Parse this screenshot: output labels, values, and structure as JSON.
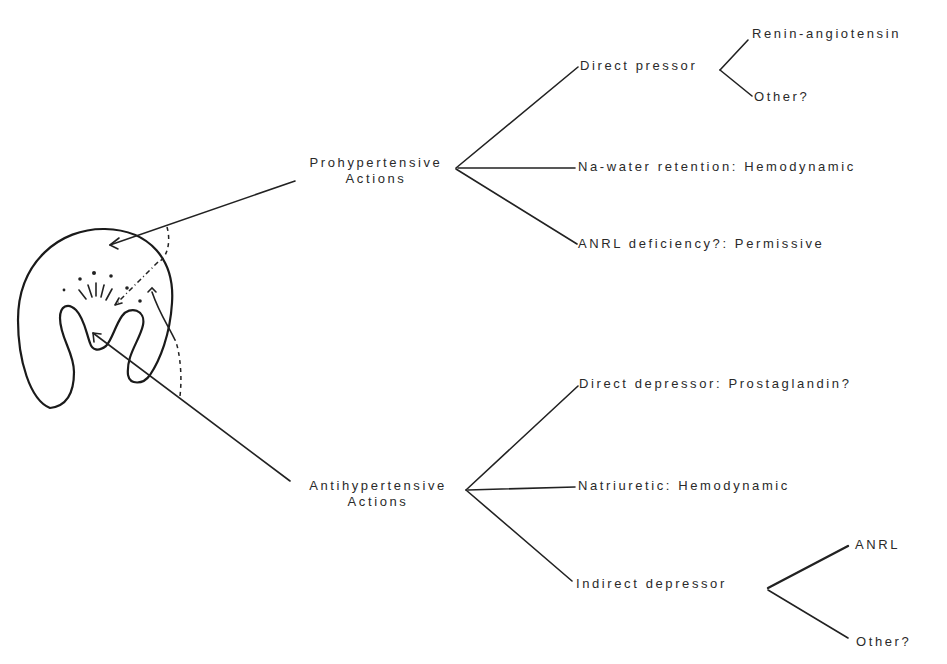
{
  "diagram": {
    "type": "tree",
    "source": {
      "label": "kidney (renal medulla sketch)"
    },
    "prohypertensive": {
      "line1": "Prohypertensive",
      "line2": "Actions",
      "branches": [
        {
          "label": "Direct pressor",
          "sub": [
            "Renin-angiotensin",
            "Other?"
          ]
        },
        {
          "label": "Na-water retention:  Hemodynamic"
        },
        {
          "label": "ANRL deficiency?:  Permissive"
        }
      ]
    },
    "antihypertensive": {
      "line1": "Antihypertensive",
      "line2": "Actions",
      "branches": [
        {
          "label": "Direct depressor:  Prostaglandin?"
        },
        {
          "label": "Natriuretic:  Hemodynamic"
        },
        {
          "label": "Indirect depressor",
          "sub": [
            "ANRL",
            "Other?"
          ]
        }
      ]
    },
    "colors": {
      "ink": "#222222",
      "background": "#ffffff"
    }
  }
}
